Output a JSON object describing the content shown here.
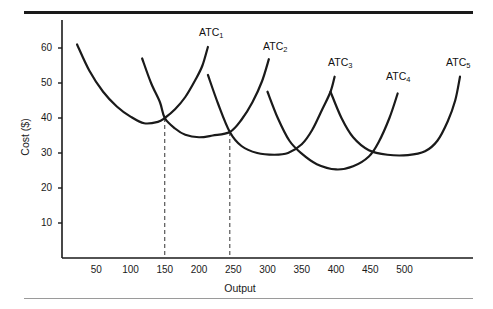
{
  "figure": {
    "background": "#ffffff",
    "line_color": "#1a1a1a",
    "rule_color_top": "#1a1a1a",
    "rule_color_bottom": "#9a9a9a"
  },
  "chart_data": {
    "type": "line",
    "title": "",
    "xlabel": "Output",
    "ylabel": "Cost ($)",
    "xlim": [
      0,
      600
    ],
    "ylim": [
      0,
      68
    ],
    "grid": false,
    "legend_position": "inline-curve-labels",
    "xticks": [
      50,
      100,
      150,
      200,
      250,
      300,
      350,
      400,
      450,
      500
    ],
    "xtick_labels": [
      "50",
      "100",
      "150",
      "200",
      "250",
      "300",
      "350",
      "400",
      "450",
      "500"
    ],
    "yticks": [
      10,
      20,
      30,
      40,
      50,
      60
    ],
    "ytick_labels": [
      "10",
      "20",
      "30",
      "40",
      "50",
      "60"
    ],
    "series": [
      {
        "name": "ATC_1",
        "label": "ATC",
        "subscript": "1",
        "minimum": {
          "x": 120,
          "y": 38.5
        },
        "points": [
          {
            "x": 22,
            "y": 61.0
          },
          {
            "x": 40,
            "y": 53.5
          },
          {
            "x": 60,
            "y": 47.5
          },
          {
            "x": 80,
            "y": 43.3
          },
          {
            "x": 100,
            "y": 40.4
          },
          {
            "x": 120,
            "y": 38.5
          },
          {
            "x": 140,
            "y": 38.9
          },
          {
            "x": 150,
            "y": 40.0
          },
          {
            "x": 165,
            "y": 42.5
          },
          {
            "x": 180,
            "y": 46.0
          },
          {
            "x": 195,
            "y": 51.0
          },
          {
            "x": 205,
            "y": 55.0
          },
          {
            "x": 213,
            "y": 60.3
          }
        ]
      },
      {
        "name": "ATC_2",
        "label": "ATC",
        "subscript": "2",
        "minimum": {
          "x": 200,
          "y": 34.5
        },
        "points": [
          {
            "x": 117,
            "y": 57.0
          },
          {
            "x": 130,
            "y": 50.0
          },
          {
            "x": 143,
            "y": 44.5
          },
          {
            "x": 150,
            "y": 40.0
          },
          {
            "x": 165,
            "y": 37.0
          },
          {
            "x": 180,
            "y": 35.2
          },
          {
            "x": 200,
            "y": 34.5
          },
          {
            "x": 220,
            "y": 35.0
          },
          {
            "x": 245,
            "y": 36.0
          },
          {
            "x": 262,
            "y": 39.5
          },
          {
            "x": 278,
            "y": 44.5
          },
          {
            "x": 292,
            "y": 50.5
          },
          {
            "x": 302,
            "y": 56.8
          }
        ]
      },
      {
        "name": "ATC_3",
        "label": "ATC",
        "subscript": "3",
        "minimum": {
          "x": 310,
          "y": 29.5
        },
        "points": [
          {
            "x": 213,
            "y": 52.3
          },
          {
            "x": 228,
            "y": 44.0
          },
          {
            "x": 245,
            "y": 36.0
          },
          {
            "x": 262,
            "y": 32.0
          },
          {
            "x": 285,
            "y": 30.0
          },
          {
            "x": 310,
            "y": 29.5
          },
          {
            "x": 330,
            "y": 30.0
          },
          {
            "x": 350,
            "y": 32.5
          },
          {
            "x": 365,
            "y": 36.5
          },
          {
            "x": 380,
            "y": 42.5
          },
          {
            "x": 392,
            "y": 47.5
          },
          {
            "x": 398,
            "y": 51.8
          }
        ]
      },
      {
        "name": "ATC_4",
        "label": "ATC",
        "subscript": "4",
        "minimum": {
          "x": 400,
          "y": 25.3
        },
        "points": [
          {
            "x": 300,
            "y": 47.5
          },
          {
            "x": 315,
            "y": 40.0
          },
          {
            "x": 332,
            "y": 33.5
          },
          {
            "x": 350,
            "y": 29.8
          },
          {
            "x": 372,
            "y": 26.8
          },
          {
            "x": 400,
            "y": 25.3
          },
          {
            "x": 425,
            "y": 26.2
          },
          {
            "x": 448,
            "y": 29.0
          },
          {
            "x": 462,
            "y": 33.0
          },
          {
            "x": 478,
            "y": 40.0
          },
          {
            "x": 490,
            "y": 47.0
          }
        ]
      },
      {
        "name": "ATC_5",
        "label": "ATC",
        "subscript": "5",
        "minimum": {
          "x": 520,
          "y": 29.5
        },
        "points": [
          {
            "x": 392,
            "y": 47.5
          },
          {
            "x": 408,
            "y": 40.0
          },
          {
            "x": 425,
            "y": 34.5
          },
          {
            "x": 448,
            "y": 30.8
          },
          {
            "x": 475,
            "y": 29.5
          },
          {
            "x": 505,
            "y": 29.4
          },
          {
            "x": 530,
            "y": 30.5
          },
          {
            "x": 548,
            "y": 33.5
          },
          {
            "x": 563,
            "y": 39.0
          },
          {
            "x": 574,
            "y": 45.0
          },
          {
            "x": 581,
            "y": 51.8
          }
        ]
      }
    ],
    "annotations": [
      {
        "type": "dashed-vline",
        "x": 150,
        "y_top": 40,
        "y_bottom": 0,
        "label": "150"
      },
      {
        "type": "dashed-vline",
        "x": 245,
        "y_top": 36,
        "y_bottom": 0,
        "label": "250"
      }
    ],
    "intersections": [
      {
        "x": 150,
        "y": 40,
        "between": [
          "ATC_1",
          "ATC_2"
        ]
      },
      {
        "x": 245,
        "y": 36,
        "between": [
          "ATC_2",
          "ATC_3"
        ]
      }
    ]
  }
}
